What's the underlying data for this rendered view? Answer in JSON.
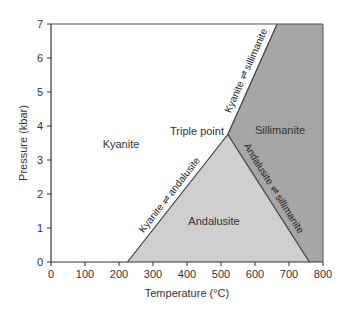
{
  "chart_data": {
    "type": "area",
    "title": "",
    "xlabel": "Temperature (°C)",
    "ylabel": "Pressure (kbar)",
    "xlim": [
      0,
      800
    ],
    "ylim": [
      0,
      7
    ],
    "x_ticks": [
      0,
      100,
      200,
      300,
      400,
      500,
      600,
      700,
      800
    ],
    "y_ticks": [
      0,
      1,
      2,
      3,
      4,
      5,
      6,
      7
    ],
    "grid": false,
    "triple_point": {
      "label": "Triple point",
      "T": 520,
      "P": 3.75
    },
    "regions": [
      {
        "name": "Kyanite",
        "color": "#ffffff",
        "label_at": [
          210,
          3.5
        ],
        "polygon": [
          [
            0,
            0
          ],
          [
            225,
            0
          ],
          [
            520,
            3.75
          ],
          [
            665,
            7
          ],
          [
            0,
            7
          ]
        ]
      },
      {
        "name": "Andalusite",
        "color": "#cfcfcf",
        "label_at": [
          480,
          1.35
        ],
        "polygon": [
          [
            225,
            0
          ],
          [
            520,
            3.75
          ],
          [
            760,
            0
          ]
        ]
      },
      {
        "name": "Sillimanite",
        "color": "#a6a6a6",
        "label_at": [
          645,
          3.6
        ],
        "polygon": [
          [
            520,
            3.75
          ],
          [
            665,
            7
          ],
          [
            800,
            7
          ],
          [
            800,
            0
          ],
          [
            760,
            0
          ]
        ]
      }
    ],
    "boundaries": [
      {
        "name": "Kyanite ⇌ andalusite",
        "points": [
          [
            225,
            0
          ],
          [
            520,
            3.75
          ]
        ]
      },
      {
        "name": "Kyanite ⇌ sillimanite",
        "points": [
          [
            520,
            3.75
          ],
          [
            665,
            7
          ]
        ]
      },
      {
        "name": "Andalusite ⇌ sillimanite",
        "points": [
          [
            520,
            3.75
          ],
          [
            760,
            0
          ]
        ]
      }
    ]
  },
  "labels": {
    "kyanite": "Kyanite",
    "andalusite": "Andalusite",
    "sillimanite": "Sillimanite",
    "triple_point": "Triple point",
    "ky_and": "Kyanite ⇌ andalusite",
    "ky_sil": "Kyanite ⇌ sillimanite",
    "and_sil": "Andalusite ⇌ sillimanite"
  }
}
